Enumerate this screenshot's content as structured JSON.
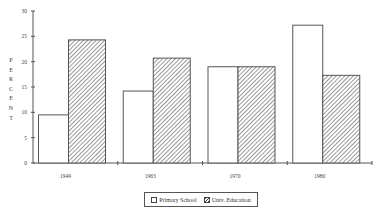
{
  "chart_data": {
    "type": "bar",
    "title": "",
    "xlabel": "",
    "ylabel": "PERCENT",
    "ylim": [
      0,
      30
    ],
    "yticks": [
      0,
      5,
      10,
      15,
      20,
      25,
      30
    ],
    "categories": [
      "1949",
      "1963",
      "1970",
      "1980"
    ],
    "series": [
      {
        "name": "Primary School",
        "values": [
          9.5,
          14.2,
          19.0,
          27.2
        ],
        "fill": "white"
      },
      {
        "name": "Univ. Education",
        "values": [
          24.3,
          20.7,
          19.0,
          17.3
        ],
        "fill": "hatched"
      }
    ],
    "grid": false,
    "legend_position": "bottom"
  },
  "legend": {
    "primary_label": "Primary School",
    "univ_label": "Univ. Education"
  },
  "axis": {
    "ylabel_letters": [
      "P",
      "E",
      "R",
      "C",
      "E",
      "N",
      "T"
    ]
  }
}
